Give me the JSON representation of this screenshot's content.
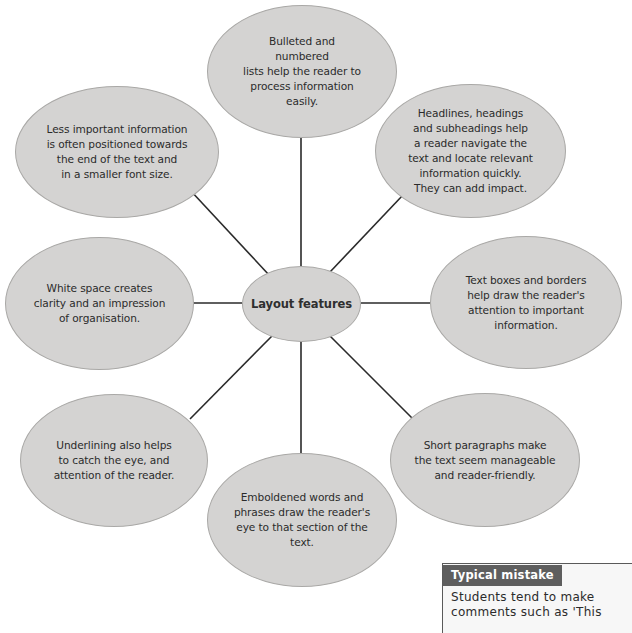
{
  "diagram": {
    "title": "Layout features",
    "colors": {
      "node_fill": "#d4d3d2",
      "node_border": "#a9a8a6",
      "connector": "#2a2a2a",
      "callout_header": "#5e5e5e"
    },
    "center": {
      "label": "Layout features"
    },
    "nodes": [
      {
        "id": "bulleted-lists",
        "text": "Bulleted and\nnumbered\nlists help the reader to\nprocess information\neasily."
      },
      {
        "id": "headlines",
        "text": "Headlines, headings\nand subheadings help\na reader navigate the\ntext and locate relevant\ninformation quickly.\nThey can add impact."
      },
      {
        "id": "text-boxes",
        "text": "Text boxes and borders\nhelp draw the reader's\nattention to important\ninformation."
      },
      {
        "id": "short-paragraphs",
        "text": "Short paragraphs make\nthe text seem manageable\nand reader-friendly."
      },
      {
        "id": "emboldened",
        "text": "Emboldened words and\nphrases draw the reader's\neye to that section of the\ntext."
      },
      {
        "id": "underlining",
        "text": "Underlining also helps\nto catch the eye, and\nattention of the reader."
      },
      {
        "id": "white-space",
        "text": "White space creates\nclarity and an impression\nof organisation."
      },
      {
        "id": "less-important",
        "text": "Less important information\nis often positioned towards\nthe end of the text and\nin a smaller font size."
      }
    ]
  },
  "callout": {
    "title": "Typical mistake",
    "body": "Students tend to make\ncomments such as 'This"
  }
}
